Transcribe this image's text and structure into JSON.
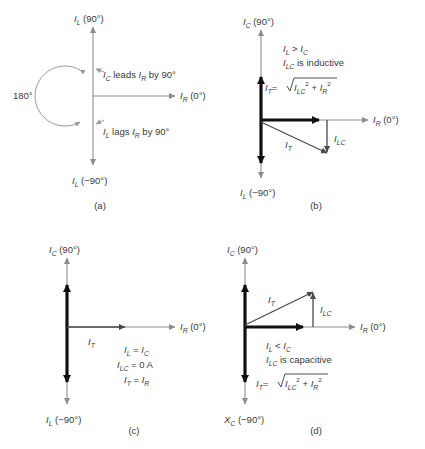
{
  "figure": {
    "colors": {
      "axis": "#8c8c8c",
      "phasor": "#111111",
      "vector": "#4a4a4a",
      "arc": "#9a9a9a",
      "text": "#3a3a3a",
      "background": "#ffffff"
    }
  },
  "panels": [
    {
      "id": "a",
      "caption": "(a)",
      "axis_up": {
        "symbol": "I",
        "subscript": "L",
        "angle": "(90°)"
      },
      "axis_down": {
        "symbol": "I",
        "subscript": "L",
        "angle": "(−90°)"
      },
      "axis_right": {
        "symbol": "I",
        "subscript": "R",
        "angle": "(0°)"
      },
      "arc_label": "180°",
      "notes": [
        {
          "lead_symbol": "I",
          "lead_sub": "C",
          "verb": "leads",
          "ref_symbol": "I",
          "ref_sub": "R",
          "tail": "by 90°"
        },
        {
          "lead_symbol": "I",
          "lead_sub": "L",
          "verb": "lags",
          "ref_symbol": "I",
          "ref_sub": "R",
          "tail": "by 90°"
        }
      ]
    },
    {
      "id": "b",
      "caption": "(b)",
      "axis_up": {
        "symbol": "I",
        "subscript": "C",
        "angle": "(90°)"
      },
      "axis_down": {
        "symbol": "I",
        "subscript": "L",
        "angle": "(−90°)"
      },
      "axis_right": {
        "symbol": "I",
        "subscript": "R",
        "angle": "(0°)"
      },
      "relation": {
        "left_symbol": "I",
        "left_sub": "L",
        "operator": ">",
        "right_symbol": "I",
        "right_sub": "C"
      },
      "statement": {
        "symbol": "I",
        "subscript": "LC",
        "text": "is inductive"
      },
      "formula": {
        "lhs_symbol": "I",
        "lhs_sub": "T",
        "equals": "=",
        "term1_symbol": "I",
        "term1_sub": "LC",
        "term1_exp": "2",
        "plus": "+",
        "term2_symbol": "I",
        "term2_sub": "R",
        "term2_exp": "2"
      },
      "vectors": [
        {
          "name": "I_T",
          "symbol": "I",
          "subscript": "T"
        },
        {
          "name": "I_LC",
          "symbol": "I",
          "subscript": "LC"
        }
      ]
    },
    {
      "id": "c",
      "caption": "(c)",
      "axis_up": {
        "symbol": "I",
        "subscript": "C",
        "angle": "(90°)"
      },
      "axis_down": {
        "symbol": "I",
        "subscript": "L",
        "angle": "(−90°)"
      },
      "axis_right": {
        "symbol": "I",
        "subscript": "R",
        "angle": "(0°)"
      },
      "equations": [
        {
          "lhs_symbol": "I",
          "lhs_sub": "L",
          "operator": "=",
          "rhs_symbol": "I",
          "rhs_sub": "C",
          "rhs_extra": ""
        },
        {
          "lhs_symbol": "I",
          "lhs_sub": "LC",
          "operator": "=",
          "rhs_symbol": "0 A",
          "rhs_sub": "",
          "rhs_extra": ""
        },
        {
          "lhs_symbol": "I",
          "lhs_sub": "T",
          "operator": "=",
          "rhs_symbol": "I",
          "rhs_sub": "R",
          "rhs_extra": ""
        }
      ],
      "vectors": [
        {
          "name": "I_T",
          "symbol": "I",
          "subscript": "T"
        }
      ]
    },
    {
      "id": "d",
      "caption": "(d)",
      "axis_up": {
        "symbol": "I",
        "subscript": "C",
        "angle": "(90°)"
      },
      "axis_down": {
        "symbol": "X",
        "subscript": "C",
        "angle": "(−90°)"
      },
      "axis_right": {
        "symbol": "I",
        "subscript": "R",
        "angle": "(0°)"
      },
      "relation": {
        "left_symbol": "I",
        "left_sub": "L",
        "operator": "<",
        "right_symbol": "I",
        "right_sub": "C"
      },
      "statement": {
        "symbol": "I",
        "subscript": "LC",
        "text": "is capacitive"
      },
      "formula": {
        "lhs_symbol": "I",
        "lhs_sub": "T",
        "equals": "=",
        "term1_symbol": "I",
        "term1_sub": "LC",
        "term1_exp": "2",
        "plus": "+",
        "term2_symbol": "I",
        "term2_sub": "R",
        "term2_exp": "2"
      },
      "vectors": [
        {
          "name": "I_T",
          "symbol": "I",
          "subscript": "T"
        },
        {
          "name": "I_LC",
          "symbol": "I",
          "subscript": "LC"
        }
      ]
    }
  ]
}
